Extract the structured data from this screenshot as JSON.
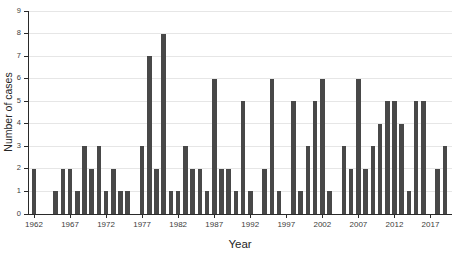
{
  "chart_data": {
    "type": "bar",
    "title": "",
    "xlabel": "Year",
    "ylabel": "Number of cases",
    "ylim": [
      0,
      9
    ],
    "y_ticks": [
      0,
      1,
      2,
      3,
      4,
      5,
      6,
      7,
      8,
      9
    ],
    "x_tick_years": [
      1962,
      1967,
      1972,
      1977,
      1982,
      1987,
      1992,
      1997,
      2002,
      2007,
      2012,
      2017
    ],
    "grid": "horizontal",
    "legend": "none",
    "bar_color": "#484848",
    "gridline_color": "#e6e6e6",
    "axis_color": "#2a2a2a",
    "tick_label_color": "#3d3d3d",
    "years": [
      1962,
      1963,
      1964,
      1965,
      1966,
      1967,
      1968,
      1969,
      1970,
      1971,
      1972,
      1973,
      1974,
      1975,
      1976,
      1977,
      1978,
      1979,
      1980,
      1981,
      1982,
      1983,
      1984,
      1985,
      1986,
      1987,
      1988,
      1989,
      1990,
      1991,
      1992,
      1993,
      1994,
      1995,
      1996,
      1997,
      1998,
      1999,
      2000,
      2001,
      2002,
      2003,
      2004,
      2005,
      2006,
      2007,
      2008,
      2009,
      2010,
      2011,
      2012,
      2013,
      2014,
      2015,
      2016,
      2017,
      2018,
      2019
    ],
    "values": [
      2,
      0,
      0,
      1,
      2,
      2,
      1,
      3,
      2,
      3,
      1,
      2,
      1,
      1,
      0,
      3,
      7,
      2,
      8,
      1,
      1,
      3,
      2,
      2,
      1,
      6,
      2,
      2,
      1,
      5,
      1,
      0,
      2,
      6,
      1,
      0,
      5,
      1,
      3,
      5,
      6,
      1,
      0,
      3,
      2,
      6,
      2,
      3,
      4,
      5,
      5,
      4,
      1,
      5,
      5,
      0,
      2,
      3
    ]
  }
}
